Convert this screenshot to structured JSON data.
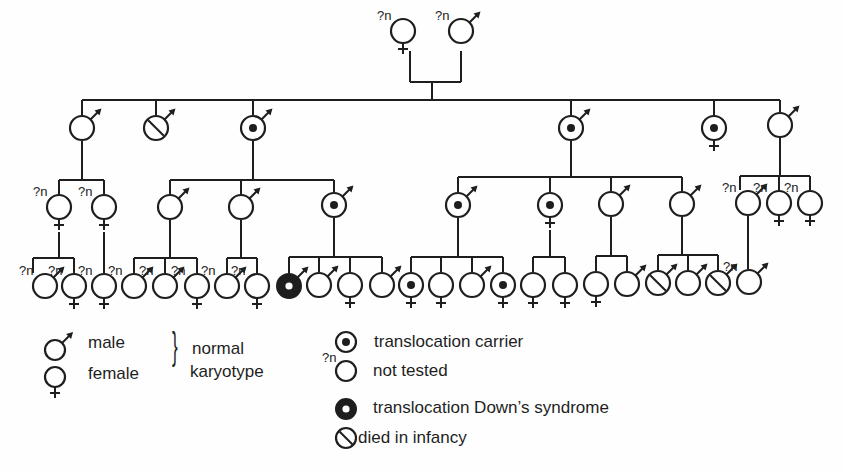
{
  "diagram": {
    "type": "pedigree",
    "colors": {
      "ink": "#1e1e1e",
      "background": "#fefefe"
    }
  },
  "legend": {
    "male": "male",
    "female": "female",
    "normal_karyotype_line1": "normal",
    "normal_karyotype_line2": "karyotype",
    "carrier": "translocation carrier",
    "not_tested": "not tested",
    "not_tested_mark": "?n",
    "downs": "translocation Down’s syndrome",
    "died": "died in infancy"
  },
  "generations": [
    {
      "label": "I",
      "members": [
        {
          "x": 403,
          "y": 31,
          "sex": "F",
          "status": "not_tested"
        },
        {
          "x": 461,
          "y": 31,
          "sex": "M",
          "status": "not_tested"
        }
      ]
    },
    {
      "label": "II",
      "members": [
        {
          "x": 82,
          "y": 128,
          "sex": "M",
          "status": "normal"
        },
        {
          "x": 156,
          "y": 128,
          "sex": "M",
          "status": "died"
        },
        {
          "x": 253,
          "y": 128,
          "sex": "M",
          "status": "carrier"
        },
        {
          "x": 571,
          "y": 128,
          "sex": "M",
          "status": "carrier"
        },
        {
          "x": 714,
          "y": 128,
          "sex": "F",
          "status": "carrier"
        },
        {
          "x": 780,
          "y": 125,
          "sex": "M",
          "status": "normal"
        }
      ]
    },
    {
      "label": "III",
      "members": [
        {
          "x": 59,
          "y": 207,
          "sex": "F",
          "status": "not_tested"
        },
        {
          "x": 104,
          "y": 207,
          "sex": "F",
          "status": "not_tested"
        },
        {
          "x": 170,
          "y": 207,
          "sex": "M",
          "status": "normal"
        },
        {
          "x": 241,
          "y": 207,
          "sex": "M",
          "status": "normal"
        },
        {
          "x": 334,
          "y": 205,
          "sex": "M",
          "status": "carrier"
        },
        {
          "x": 458,
          "y": 205,
          "sex": "M",
          "status": "carrier"
        },
        {
          "x": 550,
          "y": 205,
          "sex": "F",
          "status": "carrier"
        },
        {
          "x": 611,
          "y": 204,
          "sex": "M",
          "status": "normal"
        },
        {
          "x": 682,
          "y": 204,
          "sex": "M",
          "status": "normal"
        },
        {
          "x": 748,
          "y": 203,
          "sex": "M",
          "status": "not_tested"
        },
        {
          "x": 779,
          "y": 203,
          "sex": "F",
          "status": "not_tested"
        },
        {
          "x": 810,
          "y": 203,
          "sex": "F",
          "status": "not_tested"
        }
      ]
    },
    {
      "label": "IV",
      "members": [
        {
          "x": 45,
          "y": 286,
          "sex": "M",
          "status": "not_tested"
        },
        {
          "x": 74,
          "y": 286,
          "sex": "F",
          "status": "not_tested"
        },
        {
          "x": 104,
          "y": 286,
          "sex": "F",
          "status": "not_tested"
        },
        {
          "x": 134,
          "y": 286,
          "sex": "M",
          "status": "not_tested"
        },
        {
          "x": 165,
          "y": 286,
          "sex": "M",
          "status": "not_tested"
        },
        {
          "x": 197,
          "y": 286,
          "sex": "F",
          "status": "not_tested"
        },
        {
          "x": 227,
          "y": 286,
          "sex": "M",
          "status": "not_tested"
        },
        {
          "x": 257,
          "y": 286,
          "sex": "F",
          "status": "not_tested"
        },
        {
          "x": 289,
          "y": 286,
          "sex": "M",
          "status": "downs"
        },
        {
          "x": 319,
          "y": 285,
          "sex": "M",
          "status": "normal"
        },
        {
          "x": 350,
          "y": 285,
          "sex": "F",
          "status": "normal"
        },
        {
          "x": 382,
          "y": 285,
          "sex": "M",
          "status": "normal"
        },
        {
          "x": 411,
          "y": 285,
          "sex": "F",
          "status": "carrier"
        },
        {
          "x": 441,
          "y": 285,
          "sex": "F",
          "status": "normal"
        },
        {
          "x": 472,
          "y": 285,
          "sex": "M",
          "status": "normal"
        },
        {
          "x": 503,
          "y": 285,
          "sex": "F",
          "status": "carrier"
        },
        {
          "x": 533,
          "y": 285,
          "sex": "F",
          "status": "normal"
        },
        {
          "x": 565,
          "y": 285,
          "sex": "F",
          "status": "normal"
        },
        {
          "x": 596,
          "y": 284,
          "sex": "F",
          "status": "normal"
        },
        {
          "x": 627,
          "y": 284,
          "sex": "M",
          "status": "normal"
        },
        {
          "x": 658,
          "y": 283,
          "sex": "M",
          "status": "died"
        },
        {
          "x": 688,
          "y": 283,
          "sex": "M",
          "status": "normal"
        },
        {
          "x": 718,
          "y": 283,
          "sex": "M",
          "status": "died"
        },
        {
          "x": 749,
          "y": 282,
          "sex": "M",
          "status": "not_tested"
        }
      ]
    }
  ],
  "lines": [
    [
      410,
      51,
      410,
      82
    ],
    [
      410,
      82,
      461,
      82
    ],
    [
      461,
      82,
      461,
      51
    ],
    [
      432,
      82,
      432,
      100
    ],
    [
      82,
      100,
      780,
      100
    ],
    [
      82,
      100,
      82,
      115
    ],
    [
      156,
      100,
      156,
      115
    ],
    [
      253,
      100,
      253,
      115
    ],
    [
      571,
      100,
      571,
      115
    ],
    [
      714,
      100,
      714,
      115
    ],
    [
      780,
      100,
      780,
      112
    ],
    [
      82,
      141,
      82,
      180
    ],
    [
      59,
      180,
      104,
      180
    ],
    [
      59,
      180,
      59,
      194
    ],
    [
      104,
      180,
      104,
      194
    ],
    [
      253,
      141,
      253,
      180
    ],
    [
      170,
      180,
      334,
      180
    ],
    [
      170,
      180,
      170,
      194
    ],
    [
      241,
      180,
      241,
      194
    ],
    [
      334,
      180,
      334,
      192
    ],
    [
      571,
      141,
      571,
      177
    ],
    [
      458,
      177,
      682,
      177
    ],
    [
      458,
      177,
      458,
      192
    ],
    [
      550,
      177,
      550,
      192
    ],
    [
      611,
      177,
      611,
      191
    ],
    [
      682,
      177,
      682,
      191
    ],
    [
      780,
      138,
      780,
      176
    ],
    [
      740,
      176,
      810,
      176
    ],
    [
      740,
      176,
      740,
      190
    ],
    [
      779,
      176,
      779,
      190
    ],
    [
      810,
      176,
      810,
      190
    ],
    [
      59,
      232,
      59,
      258
    ],
    [
      33,
      258,
      74,
      258
    ],
    [
      33,
      258,
      33,
      273
    ],
    [
      74,
      258,
      74,
      273
    ],
    [
      104,
      232,
      104,
      273
    ],
    [
      170,
      220,
      170,
      258
    ],
    [
      134,
      258,
      197,
      258
    ],
    [
      134,
      258,
      134,
      273
    ],
    [
      165,
      258,
      165,
      273
    ],
    [
      197,
      258,
      197,
      273
    ],
    [
      241,
      220,
      241,
      258
    ],
    [
      227,
      258,
      257,
      258
    ],
    [
      227,
      258,
      227,
      273
    ],
    [
      257,
      258,
      257,
      273
    ],
    [
      334,
      218,
      334,
      257
    ],
    [
      289,
      257,
      382,
      257
    ],
    [
      289,
      257,
      289,
      273
    ],
    [
      319,
      257,
      319,
      272
    ],
    [
      350,
      257,
      350,
      272
    ],
    [
      382,
      257,
      382,
      272
    ],
    [
      458,
      218,
      458,
      257
    ],
    [
      411,
      257,
      503,
      257
    ],
    [
      411,
      257,
      411,
      272
    ],
    [
      441,
      257,
      441,
      272
    ],
    [
      472,
      257,
      472,
      272
    ],
    [
      503,
      257,
      503,
      272
    ],
    [
      550,
      230,
      550,
      257
    ],
    [
      533,
      257,
      565,
      257
    ],
    [
      533,
      257,
      533,
      272
    ],
    [
      565,
      257,
      565,
      272
    ],
    [
      611,
      217,
      611,
      256
    ],
    [
      596,
      256,
      627,
      256
    ],
    [
      596,
      256,
      596,
      271
    ],
    [
      627,
      256,
      627,
      271
    ],
    [
      682,
      217,
      682,
      255
    ],
    [
      658,
      255,
      718,
      255
    ],
    [
      658,
      255,
      658,
      270
    ],
    [
      688,
      255,
      688,
      270
    ],
    [
      718,
      255,
      718,
      270
    ],
    [
      748,
      216,
      748,
      269
    ]
  ],
  "legend_symbols": [
    {
      "x": 55,
      "y": 350,
      "sex": "M",
      "status": "normal"
    },
    {
      "x": 55,
      "y": 377,
      "sex": "F",
      "status": "normal"
    },
    {
      "x": 346,
      "y": 342,
      "sex": "N",
      "status": "carrier"
    },
    {
      "x": 346,
      "y": 371,
      "sex": "N",
      "status": "not_tested"
    },
    {
      "x": 346,
      "y": 409,
      "sex": "N",
      "status": "downs"
    },
    {
      "x": 346,
      "y": 438,
      "sex": "N",
      "status": "died"
    }
  ]
}
